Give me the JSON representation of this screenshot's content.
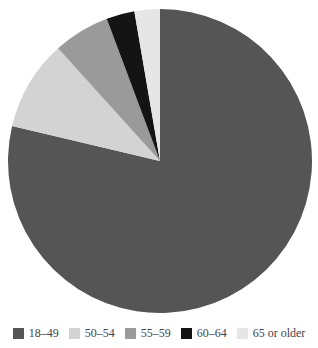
{
  "chart_data": {
    "type": "pie",
    "title": "",
    "categories": [
      "18–49",
      "50–54",
      "55–59",
      "60–64",
      "65 or older"
    ],
    "values": [
      78.7,
      9.6,
      6.0,
      3.0,
      2.7
    ],
    "colors": [
      "#555555",
      "#d3d3d3",
      "#9a9a9a",
      "#141414",
      "#e6e6e6"
    ],
    "start_angle_deg": 0,
    "direction": "clockwise",
    "legend_position": "bottom",
    "unit": "percent (estimated)"
  },
  "legend": {
    "items": [
      {
        "label": "18–49",
        "color": "#555555"
      },
      {
        "label": "50–54",
        "color": "#d3d3d3"
      },
      {
        "label": "55–59",
        "color": "#9a9a9a"
      },
      {
        "label": "60–64",
        "color": "#141414"
      },
      {
        "label": "65 or older",
        "color": "#e6e6e6"
      }
    ]
  }
}
